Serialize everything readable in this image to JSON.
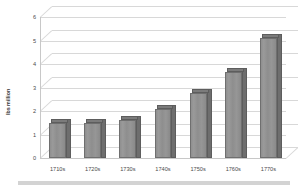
{
  "chart_data": {
    "type": "bar",
    "title": "",
    "subtitle": "",
    "xlabel": "",
    "ylabel": "lbs million",
    "categories": [
      "1710s",
      "1720s",
      "1730s",
      "1740s",
      "1750s",
      "1760s",
      "1770s"
    ],
    "values": [
      1.5,
      1.5,
      1.6,
      2.1,
      2.75,
      3.65,
      5.1
    ],
    "series": [
      {
        "name": "lbs million",
        "values": [
          1.5,
          1.5,
          1.6,
          2.1,
          2.75,
          3.65,
          5.1
        ]
      }
    ],
    "ylim": [
      0,
      6
    ],
    "ytick_labels": [
      "0",
      "1",
      "2",
      "3",
      "4",
      "5",
      "6"
    ],
    "ytick_values": [
      0,
      1,
      2,
      3,
      4,
      5,
      6
    ],
    "grid": true,
    "legend": false,
    "legend_position": "none",
    "style": "3d-column",
    "bar_color": "#8f8f8f",
    "bar_side_color": "#6e6e6e",
    "bar_top_color": "#7b7b7b",
    "gridline_color": "#d8d8d8",
    "axis_color": "#c8c8c8",
    "text_color": "#4a4a4a",
    "background_color": "#ffffff",
    "footer_color": "#d3d3d3"
  }
}
